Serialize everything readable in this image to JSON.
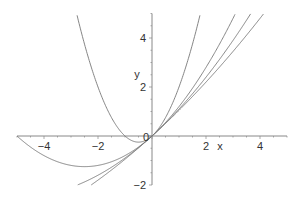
{
  "chart_data": {
    "type": "line",
    "title": "",
    "xlabel": "x",
    "ylabel": "y",
    "xlim": [
      -5,
      5
    ],
    "ylim": [
      -2,
      5
    ],
    "grid": false,
    "legend": null,
    "x_ticks": [
      -4,
      -2,
      0,
      2,
      4
    ],
    "x_tick_labels": [
      "−4",
      "−2",
      "0",
      "2",
      "4"
    ],
    "y_ticks": [
      -2,
      2,
      4
    ],
    "y_tick_labels": [
      "−2",
      "2",
      "4"
    ],
    "series": [
      {
        "name": "y = x + x^2",
        "a": 1,
        "x": [
          -2.79,
          -2,
          -1,
          -0.5,
          0,
          1,
          1.79
        ],
        "values": [
          5.0,
          2.0,
          0.0,
          -0.25,
          0.0,
          2.0,
          5.0
        ]
      },
      {
        "name": "y = x + x^2/5",
        "a": 5,
        "x": [
          -5,
          -4,
          -2.5,
          -1,
          0,
          1,
          2,
          3.09
        ],
        "values": [
          0.0,
          -0.8,
          -1.25,
          -0.8,
          0.0,
          1.2,
          2.8,
          5.0
        ]
      },
      {
        "name": "y = x + x^2/10",
        "a": 10,
        "x": [
          -2.76,
          -2,
          -1,
          0,
          1,
          2,
          3,
          3.63
        ],
        "values": [
          -2.0,
          -1.6,
          -0.9,
          0.0,
          1.1,
          2.4,
          3.9,
          5.0
        ]
      },
      {
        "name": "y = x + x^2/20",
        "a": 20,
        "x": [
          -2.25,
          -1,
          0,
          1,
          2,
          3,
          4.15
        ],
        "values": [
          -2.0,
          -0.95,
          0.0,
          1.05,
          2.2,
          3.45,
          5.0
        ]
      }
    ],
    "colors": {
      "axis": "#888888",
      "curve": "#777777",
      "text": "#333333"
    }
  }
}
